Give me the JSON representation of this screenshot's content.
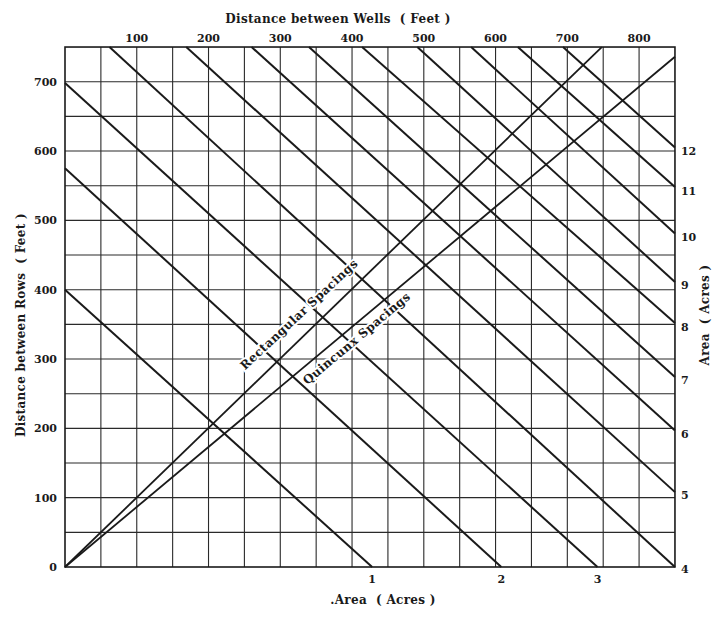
{
  "chart_data": {
    "type": "line",
    "title": "",
    "top_axis": {
      "label": "Distance between Wells  ( Feet )",
      "ticks": [
        100,
        200,
        300,
        400,
        500,
        600,
        700,
        800
      ],
      "range": [
        0,
        850
      ]
    },
    "left_axis": {
      "label": "Distance between Rows  ( Feet )",
      "ticks": [
        0,
        100,
        200,
        300,
        400,
        500,
        600,
        700
      ],
      "range": [
        0,
        750
      ]
    },
    "bottom_axis": {
      "label": ".Area  ( Acres )",
      "ticks": [
        {
          "label": "1",
          "x_ft": 428
        },
        {
          "label": "2",
          "x_ft": 608
        },
        {
          "label": "3",
          "x_ft": 742
        }
      ]
    },
    "right_axis": {
      "label": "Area  ( Acres )",
      "ticks": [
        {
          "label": "4",
          "y_ft": 3
        },
        {
          "label": "5",
          "y_ft": 109
        },
        {
          "label": "6",
          "y_ft": 197
        },
        {
          "label": "7",
          "y_ft": 275
        },
        {
          "label": "8",
          "y_ft": 352
        },
        {
          "label": "9",
          "y_ft": 412
        },
        {
          "label": "10",
          "y_ft": 482
        },
        {
          "label": "11",
          "y_ft": 548
        },
        {
          "label": "12",
          "y_ft": 606
        }
      ]
    },
    "grid": {
      "on": true,
      "x_step_ft": 50,
      "y_step_ft": 50
    },
    "area_lines": [
      {
        "name": "1 acre",
        "from": [
          0,
          400
        ],
        "to": [
          428,
          0
        ]
      },
      {
        "name": "2 acres",
        "from": [
          0,
          575
        ],
        "to": [
          608,
          0
        ]
      },
      {
        "name": "3 acres",
        "from": [
          0,
          698
        ],
        "to": [
          742,
          0
        ]
      },
      {
        "name": "4 acres",
        "from": [
          62,
          750
        ],
        "to": [
          850,
          0
        ]
      },
      {
        "name": "5 acres",
        "from": [
          169,
          750
        ],
        "to": [
          850,
          108
        ]
      },
      {
        "name": "6 acres",
        "from": [
          260,
          750
        ],
        "to": [
          850,
          197
        ]
      },
      {
        "name": "7 acres",
        "from": [
          340,
          750
        ],
        "to": [
          850,
          274
        ]
      },
      {
        "name": "8 acres",
        "from": [
          414,
          750
        ],
        "to": [
          850,
          352
        ]
      },
      {
        "name": "9 acres",
        "from": [
          491,
          750
        ],
        "to": [
          850,
          411
        ]
      },
      {
        "name": "10 acres",
        "from": [
          566,
          750
        ],
        "to": [
          850,
          481
        ]
      },
      {
        "name": "11 acres",
        "from": [
          631,
          750
        ],
        "to": [
          850,
          548
        ]
      },
      {
        "name": "12 acres",
        "from": [
          694,
          750
        ],
        "to": [
          850,
          605
        ]
      }
    ],
    "series": [
      {
        "name": "Rectangular Spacings",
        "from": [
          0,
          0
        ],
        "to": [
          748,
          750
        ]
      },
      {
        "name": "Quincunx Spacings",
        "from": [
          0,
          0
        ],
        "to": [
          850,
          736
        ]
      }
    ],
    "annotations": [
      {
        "text": "Rectangular  Spacings",
        "x_ft": 330,
        "y_ft": 360,
        "angle": -43
      },
      {
        "text": "Quincunx  Spacings",
        "x_ft": 410,
        "y_ft": 325,
        "angle": -40
      }
    ]
  },
  "layout": {
    "x0": 65,
    "y0": 567,
    "px_per_ft_x": 0.7176,
    "px_per_ft_y": 0.6933,
    "ink": "#1a1a1a",
    "grid_ink": "#2a2a2a"
  }
}
